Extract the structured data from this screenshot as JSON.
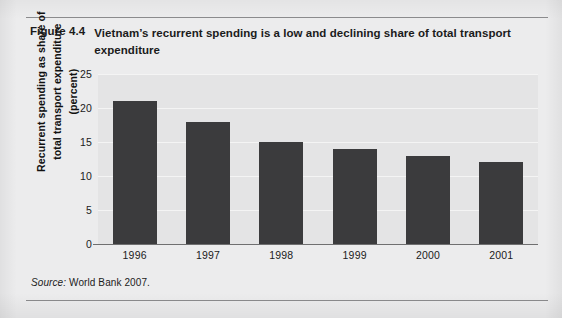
{
  "figure": {
    "number": "Figure 4.4",
    "title": "Vietnam’s recurrent spending is a low and declining share of total transport expenditure",
    "source_word": "Source:",
    "source_text": "World Bank 2007."
  },
  "chart_data": {
    "type": "bar",
    "title": "Vietnam’s recurrent spending is a low and declining share of total transport expenditure",
    "categories": [
      "1996",
      "1997",
      "1998",
      "1999",
      "2000",
      "2001"
    ],
    "values": [
      21,
      18,
      15,
      14,
      13,
      12
    ],
    "series": [
      {
        "name": "Recurrent spending as share of total transport expenditure (percent)",
        "values": [
          21,
          18,
          15,
          14,
          13,
          12
        ]
      }
    ],
    "xlabel": "",
    "ylabel": "Recurrent spending as share of total transport expenditure (percent)",
    "ylim": [
      0,
      25
    ],
    "yticks": [
      0,
      5,
      10,
      15,
      20,
      25
    ],
    "ytick_labels": [
      "0",
      "5",
      "10",
      "15",
      "20",
      "25"
    ],
    "grid": true,
    "legend": "none",
    "bar_color": "#3b3b3d",
    "plot_background": "#e4e4e5"
  }
}
